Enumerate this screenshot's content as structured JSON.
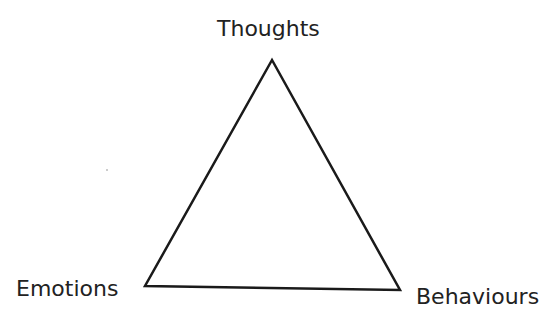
{
  "diagram": {
    "type": "triangle",
    "nodes": {
      "top": "Thoughts",
      "bottom_left": "Emotions",
      "bottom_right": "Behaviours"
    },
    "edges": [
      [
        "Thoughts",
        "Emotions"
      ],
      [
        "Emotions",
        "Behaviours"
      ],
      [
        "Behaviours",
        "Thoughts"
      ]
    ],
    "colors": {
      "line": "#1a1a1a",
      "text": "#222222"
    }
  }
}
